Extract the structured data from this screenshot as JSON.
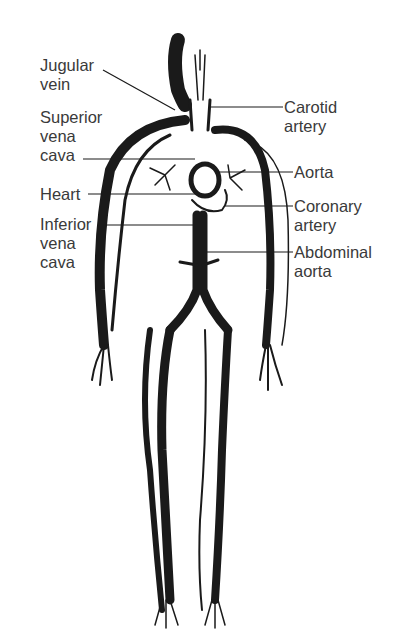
{
  "diagram": {
    "labels_left": [
      {
        "id": "jugular_vein",
        "lines": [
          "Jugular",
          "vein"
        ]
      },
      {
        "id": "superior_vena_cava",
        "lines": [
          "Superior",
          "vena",
          "cava"
        ]
      },
      {
        "id": "heart",
        "lines": [
          "Heart"
        ]
      },
      {
        "id": "inferior_vena_cava",
        "lines": [
          "Inferior",
          "vena",
          "cava"
        ]
      }
    ],
    "labels_right": [
      {
        "id": "carotid_artery",
        "lines": [
          "Carotid",
          "artery"
        ]
      },
      {
        "id": "aorta",
        "lines": [
          "Aorta"
        ]
      },
      {
        "id": "coronary_artery",
        "lines": [
          "Coronary",
          "artery"
        ]
      },
      {
        "id": "abdominal_aorta",
        "lines": [
          "Abdominal",
          "aorta"
        ]
      }
    ],
    "colors": {
      "ink": "#1a1a1a",
      "text": "#3a3a3a",
      "background": "#ffffff"
    }
  }
}
